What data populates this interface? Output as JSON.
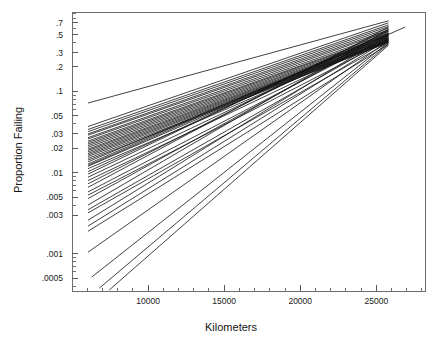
{
  "chart_data": {
    "type": "line",
    "title": "",
    "subtitle": "",
    "xlabel": "Kilometers",
    "ylabel": "Proportion Failing",
    "grid": false,
    "legend": null,
    "xscale": "linear",
    "yscale": "log",
    "xlim": [
      5000,
      28200
    ],
    "ylim": [
      0.00035,
      0.95
    ],
    "xticks": [
      10000,
      15000,
      20000,
      25000
    ],
    "xtick_labels": [
      "10000",
      "15000",
      "20000",
      "25000"
    ],
    "xminor_ticks": [
      6000,
      7000,
      8000,
      9000,
      11000,
      12000,
      13000,
      14000,
      16000,
      17000,
      18000,
      19000,
      21000,
      22000,
      23000,
      24000,
      26000,
      27000,
      28000
    ],
    "yticks": [
      0.7,
      0.5,
      0.3,
      0.2,
      0.1,
      0.05,
      0.03,
      0.02,
      0.01,
      0.005,
      0.003,
      0.001,
      0.0005
    ],
    "ytick_labels": [
      ".7",
      ".5",
      ".3",
      ".2",
      ".1",
      ".05",
      ".03",
      ".02",
      ".01",
      ".005",
      ".003",
      ".001",
      ".0005"
    ],
    "yminor_ticks": [
      0.9,
      0.8,
      0.6,
      0.4,
      0.09,
      0.08,
      0.07,
      0.06,
      0.04,
      0.009,
      0.008,
      0.007,
      0.006,
      0.004,
      0.0009,
      0.0008,
      0.0007,
      0.0006,
      0.0004
    ],
    "series_note": "Weibull/lognormal fitted percentile lines, one per unit",
    "x_start_default": 6050,
    "x_end_default": 25800,
    "series": [
      {
        "name": "line-01",
        "x": [
          6050,
          26900
        ],
        "y": [
          0.0123,
          0.62
        ],
        "width": 1.9
      },
      {
        "name": "line-02",
        "x": [
          6050,
          25800
        ],
        "y": [
          0.072,
          0.74
        ],
        "width": 0.9
      },
      {
        "name": "line-03",
        "x": [
          6050,
          25800
        ],
        "y": [
          0.037,
          0.7
        ],
        "width": 0.8
      },
      {
        "name": "line-04",
        "x": [
          6050,
          25800
        ],
        "y": [
          0.034,
          0.66
        ],
        "width": 0.8
      },
      {
        "name": "line-05",
        "x": [
          6050,
          25800
        ],
        "y": [
          0.032,
          0.63
        ],
        "width": 0.8
      },
      {
        "name": "line-06",
        "x": [
          6050,
          25800
        ],
        "y": [
          0.03,
          0.6
        ],
        "width": 0.8
      },
      {
        "name": "line-07",
        "x": [
          6050,
          25800
        ],
        "y": [
          0.029,
          0.57
        ],
        "width": 0.8
      },
      {
        "name": "line-08",
        "x": [
          6050,
          25800
        ],
        "y": [
          0.027,
          0.55
        ],
        "width": 0.8
      },
      {
        "name": "line-09",
        "x": [
          6050,
          25800
        ],
        "y": [
          0.026,
          0.52
        ],
        "width": 0.8
      },
      {
        "name": "line-10",
        "x": [
          6050,
          25800
        ],
        "y": [
          0.0245,
          0.5
        ],
        "width": 0.8
      },
      {
        "name": "line-11",
        "x": [
          6050,
          25800
        ],
        "y": [
          0.0235,
          0.49
        ],
        "width": 0.8
      },
      {
        "name": "line-12",
        "x": [
          6050,
          25800
        ],
        "y": [
          0.0225,
          0.475
        ],
        "width": 0.8
      },
      {
        "name": "line-13",
        "x": [
          6050,
          25800
        ],
        "y": [
          0.0215,
          0.46
        ],
        "width": 0.8
      },
      {
        "name": "line-14",
        "x": [
          6050,
          25800
        ],
        "y": [
          0.0205,
          0.45
        ],
        "width": 0.8
      },
      {
        "name": "line-15",
        "x": [
          6050,
          25800
        ],
        "y": [
          0.0195,
          0.44
        ],
        "width": 1.2
      },
      {
        "name": "line-16",
        "x": [
          6050,
          25800
        ],
        "y": [
          0.0188,
          0.43
        ],
        "width": 0.8
      },
      {
        "name": "line-17",
        "x": [
          6050,
          25800
        ],
        "y": [
          0.018,
          0.425
        ],
        "width": 0.8
      },
      {
        "name": "line-18",
        "x": [
          6050,
          25800
        ],
        "y": [
          0.0172,
          0.42
        ],
        "width": 0.8
      },
      {
        "name": "line-19",
        "x": [
          6050,
          25800
        ],
        "y": [
          0.0165,
          0.415
        ],
        "width": 0.8
      },
      {
        "name": "line-20",
        "x": [
          6050,
          25800
        ],
        "y": [
          0.0158,
          0.41
        ],
        "width": 0.8
      },
      {
        "name": "line-21",
        "x": [
          6050,
          25800
        ],
        "y": [
          0.015,
          0.405
        ],
        "width": 0.8
      },
      {
        "name": "line-22",
        "x": [
          6050,
          25800
        ],
        "y": [
          0.0143,
          0.4
        ],
        "width": 0.8
      },
      {
        "name": "line-23",
        "x": [
          6050,
          25800
        ],
        "y": [
          0.0136,
          0.49
        ],
        "width": 0.8
      },
      {
        "name": "line-24",
        "x": [
          6050,
          25800
        ],
        "y": [
          0.0128,
          0.52
        ],
        "width": 0.8
      },
      {
        "name": "line-25",
        "x": [
          6050,
          25800
        ],
        "y": [
          0.012,
          0.47
        ],
        "width": 0.8
      },
      {
        "name": "line-26",
        "x": [
          6050,
          25800
        ],
        "y": [
          0.0112,
          0.44
        ],
        "width": 1.4
      },
      {
        "name": "line-27",
        "x": [
          6050,
          25800
        ],
        "y": [
          0.0103,
          0.54
        ],
        "width": 0.8
      },
      {
        "name": "line-28",
        "x": [
          6050,
          25800
        ],
        "y": [
          0.0096,
          0.58
        ],
        "width": 0.8
      },
      {
        "name": "line-29",
        "x": [
          6050,
          25800
        ],
        "y": [
          0.0088,
          0.5
        ],
        "width": 0.8
      },
      {
        "name": "line-30",
        "x": [
          6050,
          25800
        ],
        "y": [
          0.008,
          0.46
        ],
        "width": 0.8
      },
      {
        "name": "line-31",
        "x": [
          6050,
          25800
        ],
        "y": [
          0.0073,
          0.56
        ],
        "width": 0.8
      },
      {
        "name": "line-32",
        "x": [
          6050,
          25800
        ],
        "y": [
          0.0066,
          0.62
        ],
        "width": 0.8
      },
      {
        "name": "line-33",
        "x": [
          6050,
          25800
        ],
        "y": [
          0.0058,
          0.48
        ],
        "width": 0.8
      },
      {
        "name": "line-34",
        "x": [
          6050,
          25800
        ],
        "y": [
          0.0053,
          0.43
        ],
        "width": 1.1
      },
      {
        "name": "line-35",
        "x": [
          6050,
          25800
        ],
        "y": [
          0.0048,
          0.52
        ],
        "width": 0.8
      },
      {
        "name": "line-36",
        "x": [
          6050,
          25800
        ],
        "y": [
          0.004,
          0.58
        ],
        "width": 0.8
      },
      {
        "name": "line-37",
        "x": [
          6050,
          25800
        ],
        "y": [
          0.0035,
          0.45
        ],
        "width": 0.8
      },
      {
        "name": "line-38",
        "x": [
          6050,
          25800
        ],
        "y": [
          0.0032,
          0.4
        ],
        "width": 0.8
      },
      {
        "name": "line-39",
        "x": [
          6050,
          25800
        ],
        "y": [
          0.0026,
          0.5
        ],
        "width": 0.8
      },
      {
        "name": "line-40",
        "x": [
          6050,
          25800
        ],
        "y": [
          0.0022,
          0.44
        ],
        "width": 1.3
      },
      {
        "name": "line-41",
        "x": [
          6050,
          25800
        ],
        "y": [
          0.0019,
          0.38
        ],
        "width": 0.8
      },
      {
        "name": "line-42",
        "x": [
          6050,
          25800
        ],
        "y": [
          0.00105,
          0.42
        ],
        "width": 0.7
      },
      {
        "name": "line-43",
        "x": [
          6300,
          25800
        ],
        "y": [
          0.00052,
          0.4
        ],
        "width": 0.7
      },
      {
        "name": "line-44",
        "x": [
          6800,
          25800
        ],
        "y": [
          0.00038,
          0.385
        ],
        "width": 0.7
      },
      {
        "name": "line-45",
        "x": [
          7450,
          25800
        ],
        "y": [
          0.00036,
          0.37
        ],
        "width": 0.7
      }
    ]
  },
  "axes": {
    "x_title": "Kilometers",
    "y_title": "Proportion Failing"
  }
}
